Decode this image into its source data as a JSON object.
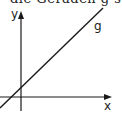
{
  "header": {
    "cut_text": "die Geraden g steigt"
  },
  "diagram": {
    "axis_x_label": "x",
    "axis_y_label": "y",
    "line_label": "g",
    "line_color": "#1a1a1a",
    "axis_color": "#1a1a1a"
  }
}
